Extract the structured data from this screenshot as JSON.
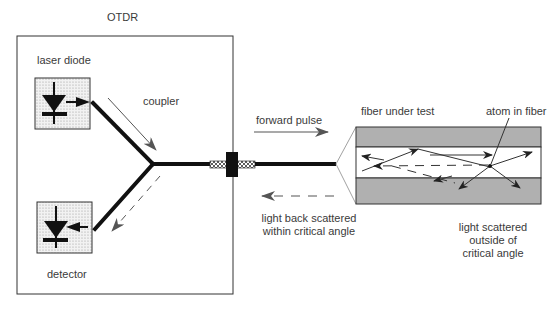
{
  "title": "OTDR",
  "labels": {
    "laser_diode": "laser diode",
    "coupler": "coupler",
    "detector": "detector",
    "forward_pulse": "forward pulse",
    "fiber_under_test": "fiber under test",
    "atom_in_fiber": "atom in fiber",
    "backscatter_line1": "light back scattered",
    "backscatter_line2": "within critical angle",
    "outside_line1": "light scattered",
    "outside_line2": "outside of",
    "outside_line3": "critical angle"
  },
  "colors": {
    "outline": "#333333",
    "fiber": "#111111",
    "arrow_gray": "#555555",
    "cladding": "#b0b0b0",
    "component_fill": "#e6e6e6"
  }
}
